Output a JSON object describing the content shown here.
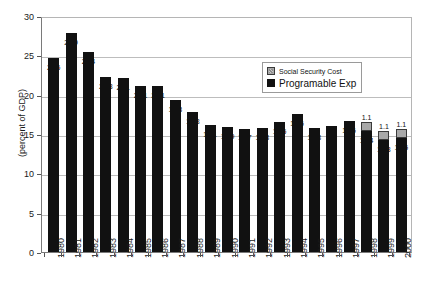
{
  "chart_data": {
    "type": "bar",
    "subtype": "stacked",
    "title": "",
    "xlabel": "",
    "ylabel": "(percent of GDP)",
    "ylim": [
      0,
      30
    ],
    "yticks": [
      0,
      5,
      10,
      15,
      20,
      25,
      30
    ],
    "grid": true,
    "legend_position": "inside-top-right",
    "categories": [
      "1980",
      "1981",
      "1982",
      "1983",
      "1984",
      "1985",
      "1986",
      "1987",
      "1988",
      "1989",
      "1990",
      "1991",
      "1992",
      "1993",
      "1994",
      "1995",
      "1996",
      "1997",
      "1998",
      "1999",
      "2000"
    ],
    "series": [
      {
        "name": "Programable Exp",
        "color": "#111111",
        "values": [
          24.6,
          27.9,
          25.4,
          22.3,
          22.1,
          21.1,
          21.1,
          19.3,
          17.8,
          16.1,
          15.9,
          15.7,
          15.8,
          16.5,
          17.6,
          15.8,
          16,
          16.6,
          15.4,
          14.3,
          14.5
        ],
        "labels": [
          "24.6",
          "27.9",
          "25.4",
          "22.3",
          "22.1",
          "21.1",
          "21.1",
          "19.3",
          "17.8",
          "16.1",
          "15.9",
          "15.7",
          "15.8",
          "16.5",
          "17.6",
          "15.8",
          "16",
          "16.6",
          "15.4",
          "14.3",
          "14.5"
        ]
      },
      {
        "name": "Social Security Cost",
        "color": "#a8a8a8",
        "values": [
          0,
          0,
          0,
          0,
          0,
          0,
          0,
          0,
          0,
          0,
          0,
          0,
          0,
          0,
          0,
          0,
          0,
          0,
          1.1,
          1.1,
          1.1
        ],
        "labels": [
          "",
          "",
          "",
          "",
          "",
          "",
          "",
          "",
          "",
          "",
          "",
          "",
          "",
          "",
          "",
          "",
          "",
          "",
          "1.1",
          "1.1",
          "1.1"
        ]
      }
    ]
  },
  "legend": {
    "items": [
      {
        "label": "Social Security Cost",
        "swatch": "gray"
      },
      {
        "label": "Programable Exp",
        "swatch": "black"
      }
    ]
  },
  "axis": {
    "y_title": "(percent of GDP)",
    "y_tick_labels": [
      "30",
      "25",
      "20",
      "15",
      "10",
      "5",
      "0"
    ]
  }
}
